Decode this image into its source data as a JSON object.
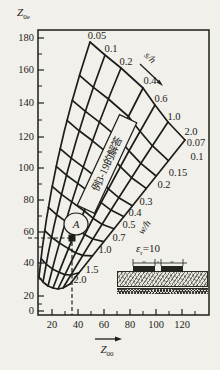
{
  "page": {
    "bg": "#f1f0ea",
    "ink": "#1d1d1b"
  },
  "chart_data": {
    "type": "nomogram",
    "description_visible_text_only": true,
    "x_axis": {
      "label_base": "Z",
      "label_sub": "00",
      "ticks": [
        20,
        40,
        60,
        80,
        100,
        120
      ],
      "tick_px": [
        52,
        78,
        104,
        130,
        156,
        182
      ],
      "minor_px": [
        65,
        91,
        117,
        143,
        169,
        195
      ]
    },
    "y_axis": {
      "label_base": "Z",
      "label_sub": "0e",
      "ticks": [
        180,
        160,
        140,
        120,
        100,
        80,
        60,
        40,
        20,
        0
      ],
      "tick_px": [
        38,
        70,
        103,
        137,
        168,
        200,
        232,
        263,
        296,
        311
      ],
      "minor_px": [
        54,
        86,
        120,
        152,
        184,
        216,
        247,
        279,
        304
      ]
    },
    "box_px": {
      "l": 38,
      "t": 30,
      "r": 209,
      "b": 315
    },
    "s_over_h": {
      "name": "s/h",
      "values": [
        0.05,
        0.1,
        0.2,
        0.4,
        0.6,
        1.0,
        2.0
      ],
      "curves": [
        {
          "label": "0.05",
          "inner": [
            39,
            277
          ],
          "outer": [
            90,
            42
          ],
          "bow": -14,
          "label_at": [
            97,
            36
          ]
        },
        {
          "label": "0.1",
          "inner": [
            43,
            282
          ],
          "outer": [
            105,
            55
          ],
          "bow": -12,
          "label_at": [
            111,
            49
          ]
        },
        {
          "label": "0.2",
          "inner": [
            48,
            286
          ],
          "outer": [
            121,
            68
          ],
          "bow": -10,
          "label_at": [
            126,
            62
          ]
        },
        {
          "label": "0.4",
          "inner": [
            53,
            288
          ],
          "outer": [
            143,
            88
          ],
          "bow": -8,
          "label_at": [
            150,
            81
          ]
        },
        {
          "label": "0.6",
          "inner": [
            58,
            289
          ],
          "outer": [
            155,
            105
          ],
          "bow": -6,
          "label_at": [
            161,
            99
          ]
        },
        {
          "label": "1.0",
          "inner": [
            63,
            288
          ],
          "outer": [
            168,
            122
          ],
          "bow": -4,
          "label_at": [
            174,
            117
          ]
        },
        {
          "label": "2.0",
          "inner": [
            70,
            284
          ],
          "outer": [
            185,
            140
          ],
          "bow": -2,
          "label_at": [
            191,
            132
          ]
        }
      ]
    },
    "w_over_h": {
      "name": "w/h",
      "values": [
        0.07,
        0.1,
        0.15,
        0.2,
        0.3,
        0.4,
        0.5,
        0.7,
        1.0,
        1.5,
        2.0
      ],
      "arcs": [
        {
          "label": "2.0",
          "u": 0.0,
          "label_at": [
            80,
            280
          ]
        },
        {
          "label": "1.5",
          "u": 0.08,
          "label_at": [
            92,
            270
          ]
        },
        {
          "label": "1.0",
          "u": 0.2,
          "label_at": [
            105,
            250
          ]
        },
        {
          "label": "0.7",
          "u": 0.3,
          "label_at": [
            119,
            238
          ]
        },
        {
          "label": "0.5",
          "u": 0.39,
          "label_at": [
            129,
            225
          ]
        },
        {
          "label": "0.4",
          "u": 0.475,
          "label_at": [
            135,
            213
          ]
        },
        {
          "label": "0.3",
          "u": 0.55,
          "label_at": [
            146,
            202
          ]
        },
        {
          "label": "0.2",
          "u": 0.67,
          "label_at": [
            164,
            185
          ]
        },
        {
          "label": "0.15",
          "u": 0.755,
          "label_at": [
            178,
            173
          ]
        },
        {
          "label": "0.1",
          "u": 0.86,
          "label_at": [
            197,
            157
          ]
        },
        {
          "label": "0.07",
          "u": 1.0,
          "label_at": [
            196,
            143
          ]
        }
      ]
    },
    "point_A": {
      "label": "A",
      "x_value": 36,
      "y_value": 56,
      "square_px": [
        72,
        238
      ],
      "circle_px": [
        76,
        224
      ]
    },
    "dashed_lines": {
      "horizontal": {
        "y_px": 238,
        "x1": 28,
        "x2": 69
      },
      "vertical": {
        "x_px": 72,
        "y1": 242,
        "y2": 315
      }
    },
    "annotation_box": {
      "text": "例3-19的解答",
      "center_px": [
        107,
        164
      ],
      "angle_deg": -65,
      "w": 100,
      "h": 19
    },
    "epsilon_label": {
      "sym": "ε",
      "sub": "r",
      "rest": "=10",
      "at_px": [
        136,
        242
      ]
    },
    "sh_arrow": {
      "line": [
        140,
        64,
        159,
        82
      ],
      "head": [
        163,
        86
      ],
      "text_at": [
        148,
        60
      ],
      "text_angle": 43
    },
    "wh_text": {
      "at_px": [
        147,
        229
      ],
      "angle": -55
    },
    "x_axis_arrow": {
      "line": [
        95,
        339,
        116,
        339
      ],
      "head": [
        122,
        339
      ]
    },
    "inset": {
      "dims": [
        "w",
        "s",
        "w"
      ],
      "dim_line": {
        "y": 263,
        "x1": 133,
        "x2": 187,
        "ticks": [
          133,
          155,
          161,
          183
        ]
      },
      "dim_label_x": [
        144,
        158,
        172
      ],
      "h_arrow_x": 203,
      "h_arrow_y1": 272,
      "h_arrow_y2": 287
    }
  }
}
